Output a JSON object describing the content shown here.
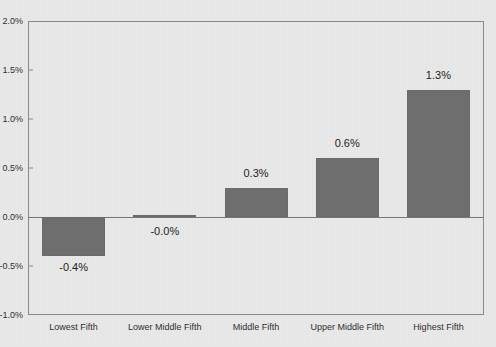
{
  "top_fragment": "",
  "chart_data": {
    "type": "bar",
    "title": "",
    "subtitle": "",
    "xlabel": "",
    "ylabel": "",
    "categories": [
      "Lowest Fifth",
      "Lower Middle Fifth",
      "Middle Fifth",
      "Upper Middle Fifth",
      "Highest Fifth"
    ],
    "values": [
      -0.4,
      -0.0,
      0.3,
      0.6,
      1.3
    ],
    "data_labels": [
      "-0.4%",
      "-0.0%",
      "0.3%",
      "0.6%",
      "1.3%"
    ],
    "ylim": [
      -1.0,
      2.0
    ],
    "yticks": [
      2.0,
      1.5,
      1.0,
      0.5,
      0.0,
      -0.5,
      -1.0
    ],
    "ytick_labels": [
      "2.0%",
      "1.5%",
      "1.0%",
      "0.5%",
      "0.0%",
      "-0.5%",
      "-1.0%"
    ],
    "grid": false,
    "legend": "none",
    "units": "percent",
    "bar_color": "#6e6e6e",
    "background_color": "#e9e9e9",
    "axis_color": "#8a8a8a"
  }
}
